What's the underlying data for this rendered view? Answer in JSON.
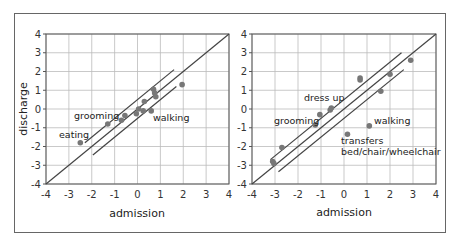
{
  "chart_data": [
    {
      "type": "scatter",
      "title": "",
      "xlabel": "admission",
      "ylabel": "discharge",
      "xlim": [
        -4,
        4
      ],
      "ylim": [
        -4,
        4
      ],
      "xticks": [
        -4,
        -3,
        -2,
        -1,
        0,
        1,
        2,
        3,
        4
      ],
      "yticks": [
        -4,
        -3,
        -2,
        -1,
        0,
        1,
        2,
        3,
        4
      ],
      "grid": true,
      "identity_line": true,
      "confidence_band_offset": 0.5,
      "band_x_range": [
        -2.3,
        1.6
      ],
      "points": [
        {
          "x": -2.5,
          "y": -1.8,
          "label": "eating"
        },
        {
          "x": -1.3,
          "y": -0.8,
          "label": "grooming"
        },
        {
          "x": -0.7,
          "y": -0.6,
          "label": ""
        },
        {
          "x": -0.55,
          "y": -0.35,
          "label": ""
        },
        {
          "x": -0.05,
          "y": -0.25,
          "label": ""
        },
        {
          "x": 0.05,
          "y": 0.0,
          "label": ""
        },
        {
          "x": 0.25,
          "y": -0.1,
          "label": ""
        },
        {
          "x": 0.3,
          "y": 0.4,
          "label": ""
        },
        {
          "x": 0.6,
          "y": -0.1,
          "label": "walking"
        },
        {
          "x": 0.7,
          "y": 1.05,
          "label": ""
        },
        {
          "x": 0.75,
          "y": 0.85,
          "label": ""
        },
        {
          "x": 0.8,
          "y": 0.65,
          "label": ""
        },
        {
          "x": 1.95,
          "y": 1.3,
          "label": ""
        }
      ]
    },
    {
      "type": "scatter",
      "title": "",
      "xlabel": "admission",
      "ylabel": "",
      "xlim": [
        -4,
        4
      ],
      "ylim": [
        -4,
        4
      ],
      "xticks": [
        -4,
        -3,
        -2,
        -1,
        0,
        1,
        2,
        3,
        4
      ],
      "yticks": [
        -4,
        -3,
        -2,
        -1,
        0,
        1,
        2,
        3,
        4
      ],
      "grid": true,
      "identity_line": true,
      "confidence_band_offset": 0.5,
      "band_x_range": [
        -3.2,
        2.5
      ],
      "points": [
        {
          "x": -3.1,
          "y": -2.8,
          "label": ""
        },
        {
          "x": -3.05,
          "y": -2.9,
          "label": ""
        },
        {
          "x": -2.7,
          "y": -2.05,
          "label": ""
        },
        {
          "x": -1.25,
          "y": -0.85,
          "label": "grooming"
        },
        {
          "x": -1.05,
          "y": -0.3,
          "label": ""
        },
        {
          "x": -0.6,
          "y": -0.05,
          "label": ""
        },
        {
          "x": -0.55,
          "y": 0.05,
          "label": "dress up"
        },
        {
          "x": 0.15,
          "y": -1.35,
          "label": "transfers bed/chair/wheelchair"
        },
        {
          "x": 0.7,
          "y": 1.55,
          "label": ""
        },
        {
          "x": 0.7,
          "y": 1.65,
          "label": ""
        },
        {
          "x": 1.1,
          "y": -0.9,
          "label": "walking"
        },
        {
          "x": 1.6,
          "y": 0.95,
          "label": ""
        },
        {
          "x": 2.0,
          "y": 1.85,
          "label": ""
        },
        {
          "x": 2.9,
          "y": 2.6,
          "label": ""
        }
      ]
    }
  ],
  "labels": {
    "ylabel": "discharge",
    "xlabel_left": "admission",
    "xlabel_right": "admission",
    "left": {
      "eating": "eating",
      "grooming": "grooming",
      "walking": "walking"
    },
    "right": {
      "dress_up": "dress up",
      "grooming": "grooming",
      "walking": "walking",
      "transfers_1": "transfers",
      "transfers_2": "bed/chair/wheelchair"
    }
  },
  "colors": {
    "point": "#777777",
    "line": "#444444",
    "grid": "#bbbbbb",
    "frame": "#666666"
  }
}
